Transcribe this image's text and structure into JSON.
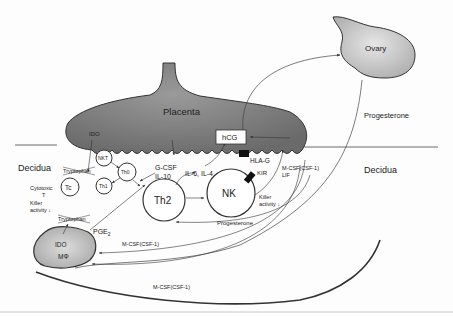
{
  "diagram": {
    "organs": {
      "placenta": "Placenta",
      "ovary": "Ovary"
    },
    "regions": {
      "decidua_left": "Decidua",
      "decidua_right": "Decidua"
    },
    "cells": {
      "nkt": "NKT",
      "th0": "Th0",
      "th1": "Th1",
      "tc": "Tc",
      "th2": "Th2",
      "nk": "NK",
      "macrophage_ido": "IDO",
      "macrophage": "MΦ"
    },
    "labels": {
      "ido_placenta": "IDO",
      "tryptophan_top": "Tryptophan",
      "tryptophan_bottom": "Tryptophan",
      "cytotoxic_1": "Cytotoxic",
      "cytotoxic_2": "T",
      "killer_left_1": "Killer",
      "killer_left_2": "activity ↓",
      "gcsf": "G-CSF",
      "il10": "IL-10",
      "il6_il4": "IL-6, IL-4",
      "hcg": "hCG",
      "hla_g": "HLA-G",
      "kir": "KIR",
      "mcsf_lif_1": "M-CSF(CSF-1)",
      "mcsf_lif_2": "LIF",
      "killer_right_1": "Killer",
      "killer_right_2": "activity ↓",
      "progesterone_top": "Progesterone",
      "progesterone_nk": "Progesterone",
      "pge2": "PGE",
      "pge2_sub": "2",
      "mcsf_mid": "M-CSF(CSF-1)",
      "mcsf_bottom": "M-CSF(CSF-1)"
    },
    "colors": {
      "placenta_fill": "#7d7d7d",
      "ovary_fill": "#c8c8c8",
      "macrophage_fill": "#bdbdbd",
      "stroke": "#333333"
    }
  }
}
